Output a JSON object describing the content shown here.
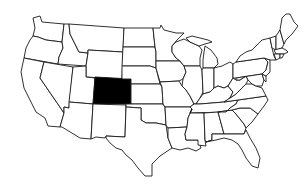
{
  "map": {
    "title": "United States map with Colorado highlighted",
    "highlighted_state": "Colorado",
    "highlight_color": "#000000",
    "state_fill": "#ffffff",
    "border_color": "#1a1a1a",
    "background": "#ffffff"
  }
}
